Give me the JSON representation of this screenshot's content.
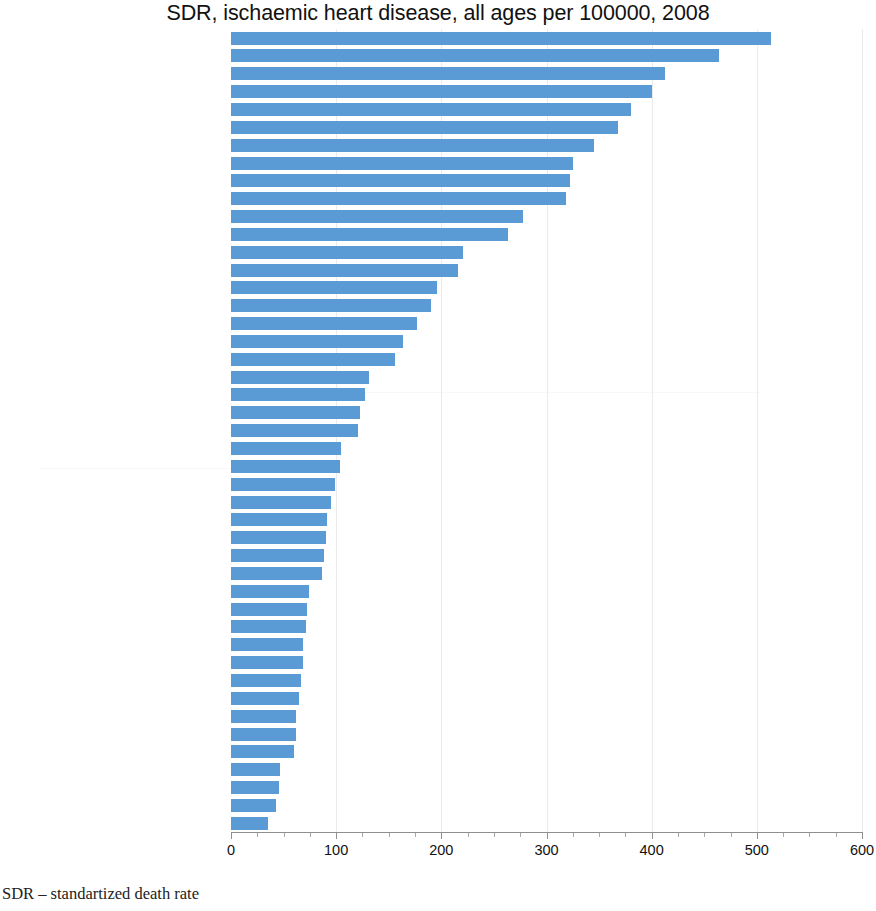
{
  "chart_data": {
    "type": "bar",
    "orientation": "horizontal",
    "title": "SDR, ischaemic heart disease, all ages per 100000, 2008",
    "xlabel": "",
    "ylabel": "",
    "xlim": [
      0,
      600
    ],
    "xticks": [
      0,
      100,
      200,
      300,
      400,
      500,
      600
    ],
    "xtick_labels": [
      "0",
      "100",
      "200",
      "300",
      "400",
      "500",
      "600"
    ],
    "minor_tick_step": 25,
    "grid": "vertical-major-faint",
    "legend": null,
    "bar_color": "#5b9bd5",
    "categories": [
      "Ukraine",
      "Republic of Moldova",
      "Kyrgyzstan",
      "Belarus",
      "CIS",
      "Russian Federation",
      "Kazakhstan",
      "Armenia",
      "Lithuania",
      "Eur-B+C",
      "Slovakia",
      "Latvia",
      "Estonia",
      "Hungary",
      "Romania",
      "European Region",
      "Czech Republic",
      "EU members since 2004 or 2007",
      "Croatia",
      "Finland",
      "Bulgaria",
      "Malta",
      "Serbia",
      "Ireland",
      "Poland",
      "Austria",
      "Iceland",
      "Sweden",
      "United Kingdom",
      "EU",
      "Germany",
      "Cyprus",
      "Eur-A",
      "Norway",
      "Slovenia",
      "Greece",
      "EU members before May 2004",
      "Montenegro",
      "Israel",
      "Italy",
      "Luxembourg",
      "Spain",
      "Netherlands",
      "Portugal",
      "France"
    ],
    "values": [
      513,
      464,
      413,
      400,
      380,
      368,
      345,
      325,
      322,
      319,
      278,
      263,
      221,
      216,
      196,
      190,
      177,
      164,
      156,
      131,
      127,
      123,
      121,
      105,
      104,
      99,
      95,
      91,
      90,
      88,
      87,
      74,
      72,
      71,
      68,
      68,
      67,
      65,
      62,
      62,
      60,
      47,
      46,
      43,
      35
    ]
  },
  "footnote": "SDR – standartized death rate"
}
